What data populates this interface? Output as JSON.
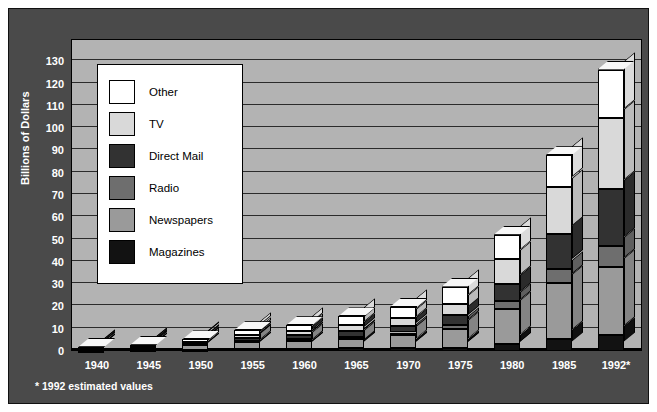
{
  "chart_data": {
    "type": "bar",
    "title": "",
    "subtitle": "",
    "xlabel": "",
    "ylabel": "Billions of Dollars",
    "ylim": [
      0,
      140
    ],
    "ytick_step": 10,
    "yticks": [
      130,
      120,
      110,
      100,
      90,
      80,
      70,
      60,
      50,
      40,
      30,
      20,
      10,
      0
    ],
    "grid": true,
    "stacked": true,
    "three_d": true,
    "legend_position": "upper-left-inside",
    "footnote": "* 1992 estimated values",
    "categories": [
      "1940",
      "1945",
      "1950",
      "1955",
      "1960",
      "1965",
      "1970",
      "1975",
      "1980",
      "1985",
      "1992*"
    ],
    "series": [
      {
        "name": "Magazines",
        "color": "#121212",
        "values": [
          0.2,
          0.4,
          0.5,
          0.8,
          0.9,
          1.2,
          1.3,
          1.5,
          3.2,
          5.2,
          7.0
        ]
      },
      {
        "name": "Newspapers",
        "color": "#9a9a9a",
        "values": [
          0.8,
          1.0,
          2.1,
          3.2,
          3.7,
          4.4,
          5.7,
          8.4,
          15.6,
          25.2,
          30.6
        ]
      },
      {
        "name": "Radio",
        "color": "#6e6e6e",
        "values": [
          0.2,
          0.4,
          0.6,
          0.5,
          0.7,
          0.9,
          1.3,
          1.9,
          3.7,
          6.5,
          9.5
        ]
      },
      {
        "name": "Direct Mail",
        "color": "#323232",
        "values": [
          0.3,
          0.4,
          0.8,
          1.3,
          1.8,
          2.3,
          2.8,
          4.2,
          7.6,
          15.4,
          25.6
        ]
      },
      {
        "name": "TV",
        "color": "#d9d9d9",
        "values": [
          0.0,
          0.0,
          0.2,
          1.5,
          1.7,
          2.8,
          3.6,
          5.3,
          11.4,
          21.5,
          31.9
        ]
      },
      {
        "name": "Other",
        "color": "#ffffff",
        "values": [
          0.4,
          0.6,
          1.0,
          2.0,
          2.8,
          3.9,
          5.0,
          7.6,
          10.7,
          14.0,
          21.7
        ]
      }
    ],
    "series_order_bottom_to_top": [
      "Magazines",
      "Newspapers",
      "Radio",
      "Direct Mail",
      "TV",
      "Other"
    ],
    "totals": [
      1.9,
      2.8,
      5.2,
      9.3,
      11.6,
      15.5,
      19.7,
      28.9,
      52.2,
      87.8,
      126.3
    ]
  },
  "legend": {
    "items": [
      {
        "label": "Other"
      },
      {
        "label": "TV"
      },
      {
        "label": "Direct Mail"
      },
      {
        "label": "Radio"
      },
      {
        "label": "Newspapers"
      },
      {
        "label": "Magazines"
      }
    ]
  },
  "colors": {
    "frame_background": "#4a4a4a",
    "plot_background": "#b3b3b3",
    "gridline": "#2b2b2b",
    "axis_text": "#ffffff",
    "legend_background": "#ffffff",
    "outline": "#000000"
  }
}
